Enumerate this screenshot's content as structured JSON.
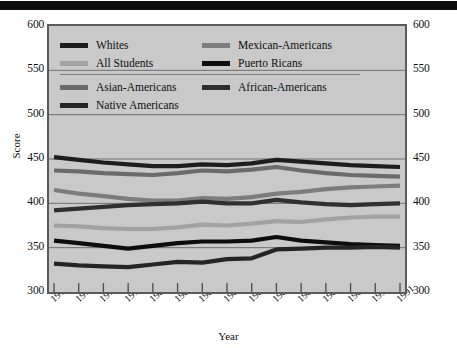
{
  "header": {
    "bar_color": "#0d0d0d"
  },
  "axes": {
    "ylabel": "Score",
    "xlabel": "Year",
    "yticks": [
      "600",
      "550",
      "500",
      "450",
      "400",
      "350",
      "300"
    ],
    "ylim": [
      300,
      600
    ],
    "gridlines": [
      600,
      550,
      500,
      450,
      400,
      350,
      300
    ],
    "plot_bg": "#c9c9c9",
    "frame_color": "#5a5a5a"
  },
  "legend": {
    "rows": [
      [
        {
          "label": "Whites",
          "color": "#1d1d1d"
        },
        {
          "label": "Mexican-Americans",
          "color": "#7d7d7d"
        }
      ],
      [
        {
          "label": "All Students",
          "color": "#a2a2a2"
        },
        {
          "label": "Puerto Ricans",
          "color": "#0d0d0d"
        }
      ]
    ],
    "rows2": [
      [
        {
          "label": "Asian-Americans",
          "color": "#6b6b6b"
        },
        {
          "label": "African-Americans",
          "color": "#303030"
        }
      ],
      [
        {
          "label": "Native Americans",
          "color": "#252525"
        },
        {
          "label": "",
          "color": ""
        }
      ]
    ]
  },
  "chart_data": {
    "type": "line",
    "title": "",
    "xlabel": "Year",
    "ylabel": "Score",
    "ylim": [
      300,
      600
    ],
    "grid": true,
    "legend_position": "top-inside",
    "categories": [
      "1976",
      "1977",
      "1978",
      "1979",
      "1980",
      "1981",
      "1982",
      "1983",
      "1984",
      "1985",
      "1987",
      "1988",
      "1989",
      "1990",
      "1991"
    ],
    "series": [
      {
        "name": "Whites",
        "color": "#1d1d1d",
        "values": [
          452,
          449,
          446,
          444,
          442,
          442,
          444,
          443,
          445,
          449,
          447,
          445,
          443,
          442,
          441
        ]
      },
      {
        "name": "Asian-Americans",
        "color": "#6b6b6b",
        "values": [
          437,
          436,
          434,
          433,
          432,
          434,
          437,
          436,
          438,
          441,
          437,
          434,
          432,
          431,
          430
        ]
      },
      {
        "name": "Mexican-Americans",
        "color": "#7d7d7d",
        "values": [
          415,
          411,
          408,
          405,
          403,
          403,
          406,
          405,
          407,
          411,
          413,
          416,
          418,
          419,
          420
        ]
      },
      {
        "name": "African-Americans",
        "color": "#303030",
        "values": [
          392,
          394,
          396,
          398,
          399,
          400,
          402,
          400,
          400,
          404,
          401,
          399,
          398,
          399,
          400
        ]
      },
      {
        "name": "All Students",
        "color": "#a2a2a2",
        "values": [
          375,
          374,
          372,
          371,
          371,
          373,
          376,
          375,
          377,
          380,
          379,
          382,
          384,
          385,
          385
        ]
      },
      {
        "name": "Puerto Ricans",
        "color": "#0d0d0d",
        "values": [
          358,
          355,
          352,
          349,
          352,
          355,
          357,
          357,
          358,
          362,
          358,
          356,
          354,
          353,
          352
        ]
      },
      {
        "name": "Native Americans",
        "color": "#252525",
        "values": [
          332,
          330,
          329,
          328,
          331,
          334,
          333,
          337,
          338,
          348,
          349,
          350,
          350,
          351,
          350
        ]
      }
    ]
  }
}
